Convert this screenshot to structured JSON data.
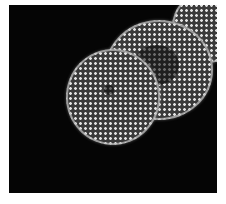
{
  "image": {
    "description": "Fluorescence microscopy of cell nuclei with punctate texture on black background",
    "background": "#050505",
    "nuclei": [
      {
        "name": "lower-left nucleus",
        "cx": 78,
        "cy": 90,
        "r": 60
      },
      {
        "name": "center nucleus",
        "cx": 147,
        "cy": 66,
        "r": 55
      },
      {
        "name": "top-right nucleus",
        "cx": 205,
        "cy": 27,
        "r": 34
      }
    ]
  }
}
